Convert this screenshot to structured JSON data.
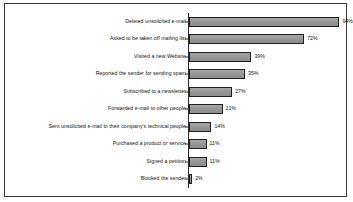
{
  "chart_data": {
    "type": "bar",
    "orientation": "horizontal",
    "title": "",
    "subtitle": "",
    "xlabel": "",
    "ylabel": "",
    "xlim": [
      0,
      100
    ],
    "grid": false,
    "legend": null,
    "value_suffix": "%",
    "bar_color": "#9a9a9a",
    "bar_edge_color": "#1f1f1f",
    "frame_color": "#3a3a3a",
    "axis_color": "#2b2b2b",
    "text_color": "#111111",
    "categories": [
      "Deleted unsolicited e-mail",
      "Asked to be taken off mailing list",
      "Visited a new Website",
      "Reported the sender for sending spam",
      "Subscribed to a newsletter",
      "Forwarded e-mail to other people",
      "Sent unsolicited e-mail to their company's technical people",
      "Purchased a product or service",
      "Signed a petition",
      "Blocked the sender"
    ],
    "values": [
      94,
      72,
      39,
      35,
      27,
      21,
      14,
      11,
      11,
      2
    ],
    "value_labels": [
      "94%",
      "72%",
      "39%",
      "35%",
      "27%",
      "21%",
      "14%",
      "11%",
      "11%",
      "2%"
    ]
  }
}
